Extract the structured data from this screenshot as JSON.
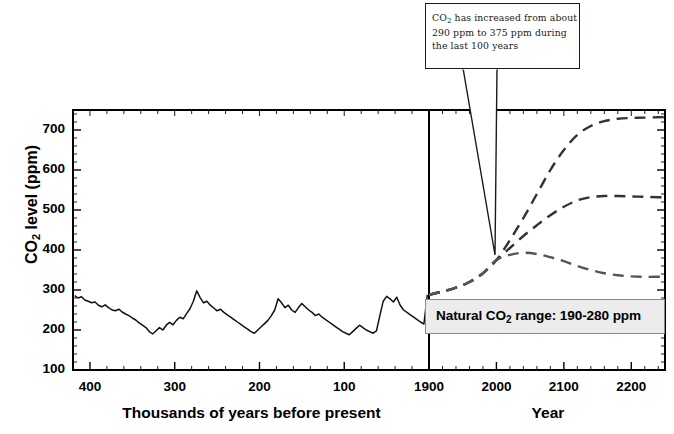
{
  "chart_data": {
    "type": "line",
    "title": "",
    "ylabel": "CO2 level (ppm)",
    "ylabel_parts": {
      "pre": "CO",
      "sub": "2",
      "post": " level (ppm)"
    },
    "ylim": [
      100,
      750
    ],
    "yticks": [
      100,
      200,
      300,
      400,
      500,
      600,
      700
    ],
    "ytick_labels": [
      "100",
      "200",
      "300",
      "400",
      "500",
      "600",
      "700"
    ],
    "grid": false,
    "legend": "none",
    "panels": [
      {
        "name": "ice-core-record",
        "xlabel": "Thousands of years before present",
        "xticks": [
          400,
          300,
          200,
          100
        ],
        "xtick_labels": [
          "400",
          "300",
          "200",
          "100"
        ],
        "xlim": [
          420,
          0
        ],
        "x_direction": "descending",
        "series_name": "Ice core CO2 record",
        "style": "solid",
        "color": "#111111",
        "x": [
          418,
          414,
          410,
          406,
          402,
          398,
          394,
          390,
          386,
          382,
          378,
          374,
          370,
          366,
          362,
          358,
          354,
          350,
          346,
          342,
          338,
          334,
          330,
          326,
          322,
          318,
          314,
          310,
          306,
          302,
          298,
          294,
          290,
          286,
          282,
          278,
          274,
          270,
          266,
          262,
          258,
          254,
          250,
          246,
          242,
          238,
          234,
          230,
          226,
          222,
          218,
          214,
          210,
          206,
          202,
          198,
          194,
          190,
          186,
          182,
          178,
          174,
          170,
          166,
          162,
          158,
          154,
          150,
          146,
          142,
          138,
          134,
          130,
          126,
          122,
          118,
          114,
          110,
          106,
          102,
          98,
          94,
          90,
          86,
          82,
          78,
          74,
          70,
          66,
          62,
          58,
          54,
          50,
          46,
          42,
          38,
          34,
          30,
          26,
          22,
          18,
          14,
          10,
          6,
          2
        ],
        "y": [
          286,
          280,
          283,
          275,
          272,
          268,
          270,
          262,
          258,
          263,
          256,
          250,
          248,
          252,
          245,
          240,
          236,
          230,
          225,
          218,
          212,
          206,
          196,
          190,
          198,
          206,
          200,
          212,
          219,
          213,
          224,
          232,
          228,
          241,
          253,
          272,
          298,
          281,
          268,
          272,
          262,
          255,
          248,
          252,
          244,
          238,
          232,
          226,
          220,
          214,
          208,
          202,
          196,
          192,
          200,
          208,
          216,
          224,
          236,
          250,
          278,
          268,
          256,
          262,
          250,
          244,
          256,
          266,
          258,
          250,
          244,
          236,
          240,
          232,
          226,
          220,
          214,
          208,
          202,
          196,
          192,
          188,
          196,
          204,
          212,
          206,
          200,
          196,
          192,
          198,
          236,
          272,
          284,
          278,
          270,
          282,
          262,
          250,
          244,
          238,
          232,
          226,
          220,
          215,
          288
        ],
        "note": "Approximate Vostok-style ice core CO2 record oscillating between ~180 and ~300 ppm"
      },
      {
        "name": "future-projections",
        "xlabel": "Year",
        "xticks": [
          1900,
          2000,
          2100,
          2200
        ],
        "xtick_labels": [
          "1900",
          "2000",
          "2100",
          "2200"
        ],
        "xlim": [
          1900,
          2250
        ],
        "series": [
          {
            "name": "high-emissions-scenario",
            "style": "dashed",
            "color": "#333333",
            "x": [
              1900,
              1920,
              1940,
              1960,
              1980,
              2000,
              2020,
              2040,
              2060,
              2080,
              2100,
              2120,
              2140,
              2160,
              2180,
              2200,
              2220,
              2240,
              2250
            ],
            "y": [
              288,
              296,
              306,
              320,
              342,
              375,
              425,
              480,
              540,
              600,
              650,
              688,
              710,
              722,
              728,
              730,
              731,
              732,
              732
            ]
          },
          {
            "name": "medium-emissions-scenario",
            "style": "dashed",
            "color": "#333333",
            "x": [
              1900,
              1920,
              1940,
              1960,
              1980,
              2000,
              2020,
              2040,
              2060,
              2080,
              2100,
              2120,
              2140,
              2160,
              2180,
              2200,
              2220,
              2240,
              2250
            ],
            "y": [
              288,
              296,
              306,
              320,
              342,
              375,
              405,
              435,
              462,
              487,
              508,
              524,
              532,
              535,
              535,
              534,
              533,
              532,
              532
            ]
          },
          {
            "name": "low-emissions-scenario",
            "style": "dashed",
            "color": "#555555",
            "x": [
              1900,
              1920,
              1940,
              1960,
              1980,
              2000,
              2020,
              2040,
              2060,
              2080,
              2100,
              2120,
              2140,
              2160,
              2180,
              2200,
              2220,
              2240,
              2250
            ],
            "y": [
              288,
              296,
              306,
              320,
              342,
              375,
              388,
              393,
              390,
              382,
              372,
              360,
              350,
              342,
              337,
              334,
              333,
              333,
              333
            ]
          }
        ]
      }
    ],
    "annotations": [
      {
        "name": "callout",
        "text_parts": {
          "pre": "CO",
          "sub": "2",
          "post": " has increased from about 290 ppm to 375 ppm during the last 100 years"
        },
        "text": "CO2 has increased from about 290 ppm to 375 ppm during the last 100 years",
        "points_to": {
          "year": 2000,
          "ppm": 375
        }
      },
      {
        "name": "natural-range",
        "text_parts": {
          "pre": "Natural CO",
          "sub": "2",
          "post": " range: 190-280 ppm"
        },
        "text": "Natural CO2 range: 190-280 ppm",
        "range_low_ppm": 190,
        "range_high_ppm": 280
      }
    ],
    "divider": {
      "name": "present-day-divider",
      "at_year": 1900
    }
  },
  "colors": {
    "axis": "#000000",
    "ice_core_line": "#111111",
    "projection_line": "#333333",
    "range_box_fill": "#ececec",
    "range_box_border": "#8a8a8a",
    "callout_border": "#1a1a1a"
  }
}
